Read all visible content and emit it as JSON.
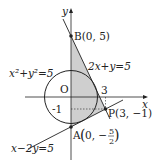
{
  "diagram": {
    "axes": {
      "x_label": "x",
      "y_label": "y",
      "origin_label": "O"
    },
    "ticks": {
      "x_tick": "3",
      "y_tick": "-1"
    },
    "points": {
      "B": {
        "label": "B(0, 5)",
        "x": 0,
        "y": 5
      },
      "A": {
        "label_prefix": "A",
        "x_text": "0, −",
        "frac_num": "5",
        "frac_den": "2",
        "x": 0,
        "y": -2.5
      },
      "P": {
        "label": "P(3, −1)",
        "x": 3,
        "y": -1
      }
    },
    "curves": {
      "circle": {
        "label": "x²+y²=5",
        "radius_squared": 5
      },
      "line1": {
        "label": "2x+y=5"
      },
      "line2": {
        "label": "x−2y=5"
      }
    },
    "colors": {
      "shade": "#c8c8c8",
      "stroke": "#222222"
    }
  }
}
